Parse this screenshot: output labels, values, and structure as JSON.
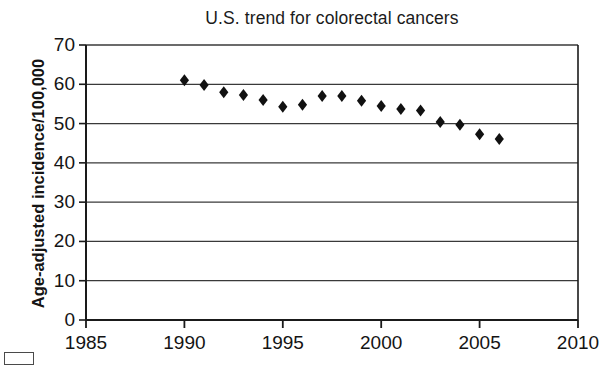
{
  "chart_data": {
    "type": "scatter",
    "title": "U.S. trend for colorectal cancers",
    "xlabel": "",
    "ylabel": "Age-adjusted incidence/100,000",
    "xlim": [
      1985,
      2010
    ],
    "ylim": [
      0,
      70
    ],
    "xticks": [
      1985,
      1990,
      1995,
      2000,
      2005,
      2010
    ],
    "yticks": [
      0,
      10,
      20,
      30,
      40,
      50,
      60,
      70
    ],
    "xtick_labels": [
      "1985",
      "1990",
      "1995",
      "2000",
      "2005",
      "2010"
    ],
    "ytick_labels": [
      "0",
      "10",
      "20",
      "30",
      "40",
      "50",
      "60",
      "70"
    ],
    "grid": "horizontal",
    "legend": "none",
    "marker": "diamond",
    "marker_color": "#111111",
    "series": [
      {
        "name": "U.S. colorectal cancer incidence",
        "x": [
          1990,
          1991,
          1992,
          1993,
          1994,
          1995,
          1996,
          1997,
          1998,
          1999,
          2000,
          2001,
          2002,
          2003,
          2004,
          2005,
          2006
        ],
        "values": [
          61.0,
          59.8,
          58.0,
          57.3,
          56.0,
          54.3,
          54.8,
          57.0,
          57.0,
          55.8,
          54.5,
          53.7,
          53.3,
          50.4,
          49.7,
          47.3,
          46.1
        ]
      }
    ]
  },
  "axes": {
    "title": "U.S. trend for colorectal cancers",
    "y_axis_title": "Age-adjusted incidence/100,000"
  },
  "colors": {
    "marker": "#111111",
    "gridline": "#3a3a3a",
    "axis": "#1a1a1a",
    "background": "#ffffff"
  }
}
